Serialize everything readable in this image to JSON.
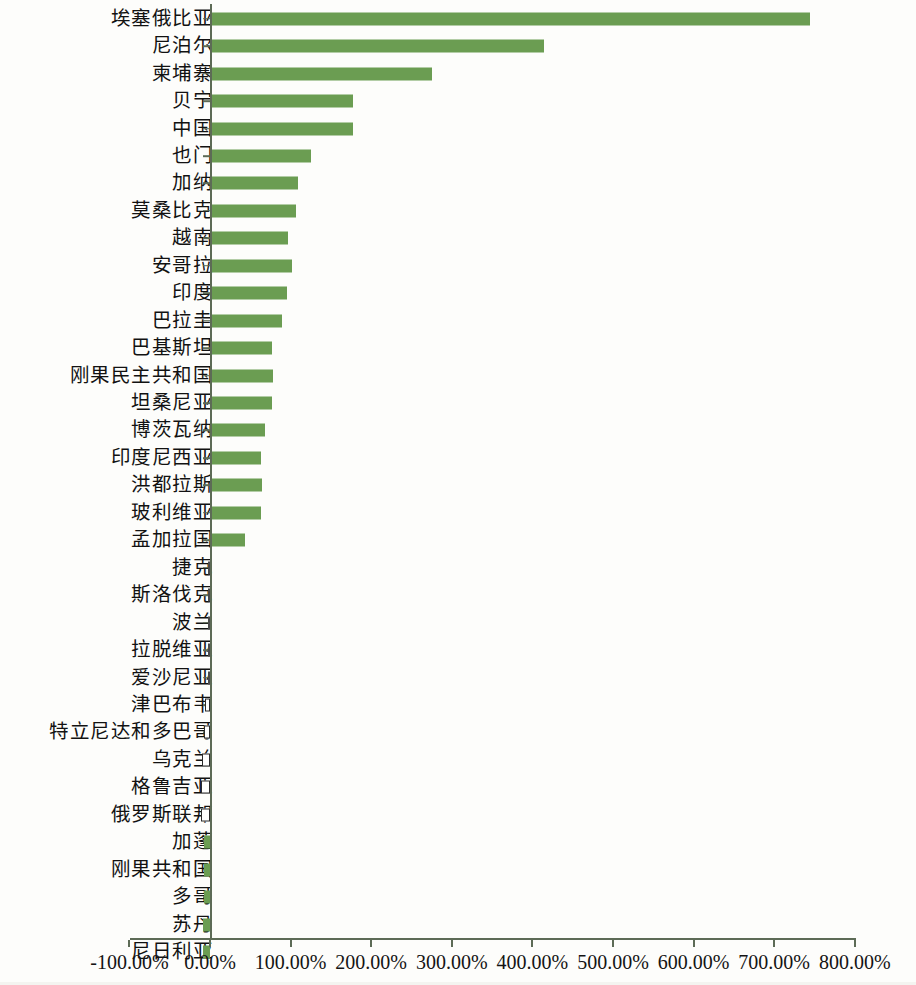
{
  "chart_data": {
    "type": "bar",
    "orientation": "horizontal",
    "title": "",
    "subtitle": "",
    "xlabel": "",
    "ylabel": "",
    "xlim": [
      -100,
      800
    ],
    "xtick_labels": [
      "-100.00%",
      "0.00%",
      "100.00%",
      "200.00%",
      "300.00%",
      "400.00%",
      "500.00%",
      "600.00%",
      "700.00%",
      "800.00%"
    ],
    "xtick_values": [
      -100,
      0,
      100,
      200,
      300,
      400,
      500,
      600,
      700,
      800
    ],
    "grid": false,
    "legend": false,
    "bar_color": "#6b9d52",
    "axis_color": "#5d6b56",
    "value_unit": "percent",
    "categories": [
      "埃塞俄比亚",
      "尼泊尔",
      "柬埔寨",
      "贝宁",
      "中国",
      "也门",
      "加纳",
      "莫桑比克",
      "越南",
      "安哥拉",
      "印度",
      "巴拉圭",
      "巴基斯坦",
      "刚果民主共和国",
      "坦桑尼亚",
      "博茨瓦纳",
      "印度尼西亚",
      "洪都拉斯",
      "玻利维亚",
      "孟加拉国",
      "捷克",
      "斯洛伐克",
      "波兰",
      "拉脱维亚",
      "爱沙尼亚",
      "津巴布韦",
      "特立尼达和多巴哥",
      "乌克兰",
      "格鲁吉亚",
      "俄罗斯联邦",
      "加蓬",
      "刚果共和国",
      "多哥",
      "苏丹",
      "尼日利亚"
    ],
    "values": [
      745,
      414,
      276,
      178,
      177,
      125,
      109,
      107,
      97,
      102,
      96,
      89,
      77,
      78,
      77,
      68,
      63,
      64,
      63,
      43,
      -2,
      -2,
      -2,
      -2,
      -2,
      -3,
      -4,
      -5,
      -6,
      -6,
      -8,
      -8,
      -8,
      -9,
      -9
    ]
  }
}
